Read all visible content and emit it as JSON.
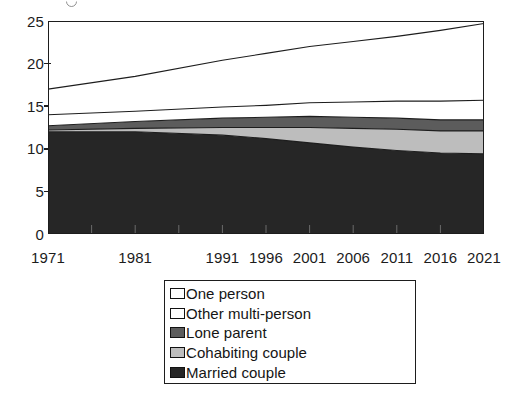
{
  "chart_data": {
    "type": "area",
    "stacked": true,
    "title": "",
    "subtitle": "",
    "xlabel": "",
    "ylabel": "",
    "grid": false,
    "legend_position": "bottom-center",
    "x": [
      1971,
      1981,
      1991,
      1996,
      2001,
      2006,
      2011,
      2016,
      2021
    ],
    "categories": [
      "1971",
      "1981",
      "1991",
      "1996",
      "2001",
      "2006",
      "2011",
      "2016",
      "2021"
    ],
    "xlim": [
      1971,
      2021
    ],
    "ylim": [
      0,
      25
    ],
    "yticks": [
      0,
      5,
      10,
      15,
      20,
      25
    ],
    "ytick_labels": [
      "0",
      "5",
      "10",
      "15",
      "20",
      "25"
    ],
    "x_minor_ticks": [
      1976,
      1986
    ],
    "units": "millions of households",
    "series": [
      {
        "name": "Married couple",
        "color": "#262626",
        "values": [
          12.0,
          12.0,
          11.6,
          11.2,
          10.7,
          10.2,
          9.8,
          9.5,
          9.4
        ]
      },
      {
        "name": "Cohabiting couple",
        "color": "#bdbdbd",
        "values": [
          0.2,
          0.4,
          0.9,
          1.3,
          1.8,
          2.2,
          2.5,
          2.6,
          2.7
        ]
      },
      {
        "name": "Lone parent",
        "color": "#5c5c5c",
        "values": [
          0.5,
          0.8,
          1.1,
          1.2,
          1.3,
          1.3,
          1.3,
          1.3,
          1.3
        ]
      },
      {
        "name": "Other multi-person",
        "color": "#ffffff",
        "values": [
          1.3,
          1.2,
          1.3,
          1.4,
          1.6,
          1.8,
          2.0,
          2.2,
          2.3
        ]
      },
      {
        "name": "One person",
        "color": "#ffffff",
        "values": [
          3.0,
          4.1,
          5.5,
          6.1,
          6.6,
          7.1,
          7.6,
          8.3,
          9.0
        ]
      }
    ],
    "cumulative_totals": [
      17.0,
      18.5,
      20.4,
      21.2,
      22.0,
      22.6,
      23.2,
      23.9,
      24.7
    ]
  },
  "yaxis": {
    "ticks": [
      {
        "label": "25",
        "value": 25
      },
      {
        "label": "20",
        "value": 20
      },
      {
        "label": "15",
        "value": 15
      },
      {
        "label": "10",
        "value": 10
      },
      {
        "label": "5",
        "value": 5
      },
      {
        "label": "0",
        "value": 0
      }
    ]
  },
  "xaxis": {
    "labels": [
      {
        "text": "1971",
        "value": 1971
      },
      {
        "text": "1981",
        "value": 1981
      },
      {
        "text": "1991",
        "value": 1991
      },
      {
        "text": "1996",
        "value": 1996
      },
      {
        "text": "2001",
        "value": 2001
      },
      {
        "text": "2006",
        "value": 2006
      },
      {
        "text": "2011",
        "value": 2011
      },
      {
        "text": "2016",
        "value": 2016
      },
      {
        "text": "2021",
        "value": 2021
      }
    ]
  },
  "legend": {
    "items": [
      {
        "label": "One person",
        "swatch": "#ffffff"
      },
      {
        "label": "Other multi-person",
        "swatch": "#ffffff"
      },
      {
        "label": "Lone parent",
        "swatch": "#5c5c5c"
      },
      {
        "label": "Cohabiting couple",
        "swatch": "#bdbdbd"
      },
      {
        "label": "Married couple",
        "swatch": "#262626"
      }
    ]
  },
  "colors": {
    "axis": "#1d1d1d",
    "text": "#1c1c1c",
    "background": "#ffffff",
    "married_couple": "#262626",
    "cohabiting_couple": "#bdbdbd",
    "lone_parent": "#5c5c5c",
    "other_multi_person": "#ffffff",
    "one_person": "#ffffff"
  }
}
